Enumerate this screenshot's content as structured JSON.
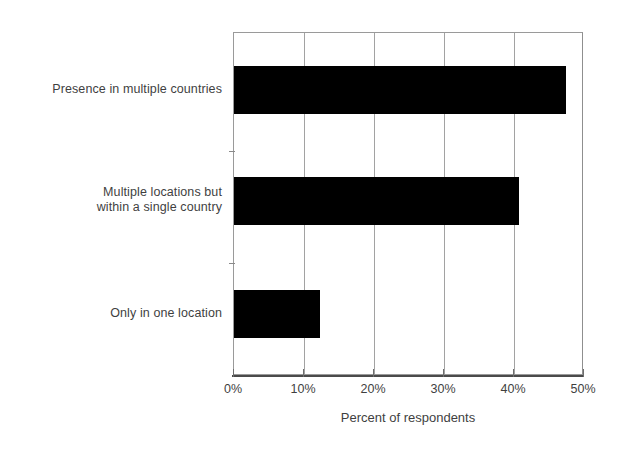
{
  "chart_data": {
    "type": "bar",
    "orientation": "horizontal",
    "title": "",
    "xlabel": "Percent of respondents",
    "ylabel": "",
    "categories": [
      "Presence in multiple countries",
      "Multiple locations but\nwithin a single country",
      "Only in one location"
    ],
    "values": [
      47.4,
      40.7,
      12.3
    ],
    "xlim": [
      0,
      50
    ],
    "xticks": [
      0,
      10,
      20,
      30,
      40,
      50
    ],
    "xticklabels": [
      "0%",
      "10%",
      "20%",
      "30%",
      "40%",
      "50%"
    ],
    "grid": "vertical",
    "legend": "none",
    "bar_color": "#000000",
    "gridline_color": "#a2a2a2",
    "text_color": "#3f3f3f"
  }
}
